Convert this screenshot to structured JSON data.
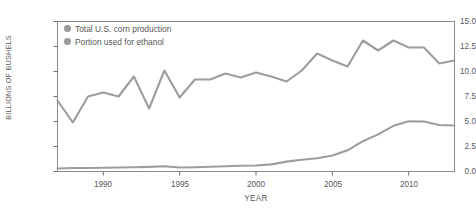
{
  "chart_data": {
    "type": "line",
    "title": "",
    "xlabel": "YEAR",
    "ylabel": "BILLIONS OF BUSHELS",
    "xlim": [
      1987,
      2013
    ],
    "ylim": [
      0.0,
      15.0
    ],
    "grid": false,
    "legend_position": "top-left",
    "x": [
      1987,
      1988,
      1989,
      1990,
      1991,
      1992,
      1993,
      1994,
      1995,
      1996,
      1997,
      1998,
      1999,
      2000,
      2001,
      2002,
      2003,
      2004,
      2005,
      2006,
      2007,
      2008,
      2009,
      2010,
      2011,
      2012,
      2013
    ],
    "series": [
      {
        "name": "Total U.S. corn production",
        "color": "#9d9d9d",
        "values": [
          7.1,
          4.9,
          7.5,
          7.9,
          7.5,
          9.5,
          6.3,
          10.1,
          7.4,
          9.2,
          9.2,
          9.8,
          9.4,
          9.9,
          9.5,
          9.0,
          10.1,
          11.8,
          11.1,
          10.5,
          13.1,
          12.1,
          13.1,
          12.4,
          12.4,
          10.8,
          11.1
        ]
      },
      {
        "name": "Portion used for ethanol",
        "color": "#9d9d9d",
        "values": [
          0.3,
          0.35,
          0.35,
          0.38,
          0.4,
          0.42,
          0.46,
          0.52,
          0.4,
          0.43,
          0.48,
          0.53,
          0.57,
          0.6,
          0.71,
          0.99,
          1.17,
          1.32,
          1.6,
          2.12,
          3.03,
          3.71,
          4.57,
          5.02,
          5.0,
          4.65,
          4.6
        ]
      }
    ],
    "yticks": [
      "0.0",
      "2.5",
      "5.0",
      "7.5",
      "10.0",
      "12.5",
      "15.0"
    ],
    "ytick_values": [
      0.0,
      2.5,
      5.0,
      7.5,
      10.0,
      12.5,
      15.0
    ],
    "xticks": [
      "1990",
      "1995",
      "2000",
      "2005",
      "2010"
    ],
    "xtick_values": [
      1990,
      1995,
      2000,
      2005,
      2010
    ]
  },
  "colors": {
    "line": "#9d9d9d",
    "axis": "#6d6e71",
    "text": "#58595b",
    "background": "#ffffff"
  }
}
